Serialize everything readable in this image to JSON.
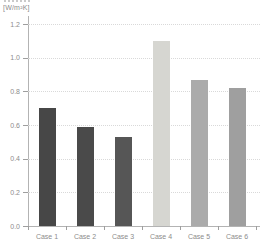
{
  "chart_data": {
    "type": "bar",
    "title": "",
    "unit_label": "[W/m²K]",
    "categories": [
      "Case 1",
      "Case 2",
      "Case 3",
      "Case 4",
      "Case 5",
      "Case 6"
    ],
    "values": [
      0.7,
      0.59,
      0.53,
      1.1,
      0.87,
      0.82
    ],
    "bar_colors": [
      "#474747",
      "#4a4a4a",
      "#565656",
      "#d6d6d1",
      "#ababab",
      "#9f9f9f"
    ],
    "ylim": [
      0.0,
      1.2
    ],
    "yticks": [
      0.0,
      0.2,
      0.4,
      0.6,
      0.8,
      1.0,
      1.2
    ],
    "ytick_labels": [
      "0.0",
      "0.2",
      "0.4",
      "0.6",
      "0.8",
      "1.0",
      "1.2"
    ],
    "xlabel": "",
    "ylabel": "",
    "grid": "horizontal-dotted",
    "legend": "none",
    "colors": {
      "axis": "#b3b3b3",
      "grid": "#d9d9d9",
      "label": "#8c8c8c"
    }
  }
}
